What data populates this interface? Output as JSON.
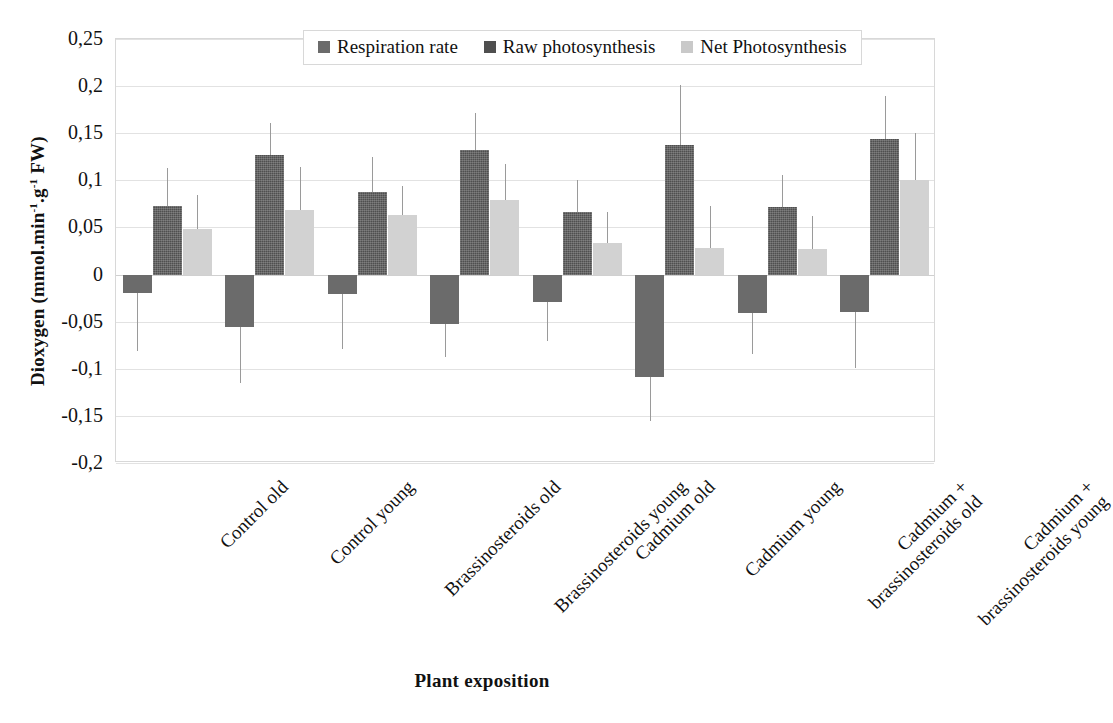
{
  "chart_data": {
    "type": "bar",
    "title": "",
    "xlabel": "Plant exposition",
    "ylabel": "Dioxygen (mmol.min-1.g-1 FW)",
    "ylabel_parts": {
      "main": "Dioxygen (mmol.min",
      "sup1": "-1",
      "mid": ".g",
      "sup2": "-1",
      "tail": " FW)"
    },
    "ylim": [
      -0.2,
      0.25
    ],
    "ytick_labels": [
      "0,25",
      "0,2",
      "0,15",
      "0,1",
      "0,05",
      "0",
      "-0,05",
      "-0,1",
      "-0,15",
      "-0,2"
    ],
    "ytick_values": [
      0.25,
      0.2,
      0.15,
      0.1,
      0.05,
      0,
      -0.05,
      -0.1,
      -0.15,
      -0.2
    ],
    "grid": true,
    "legend_position": "top-center",
    "decimal_separator": ",",
    "categories": [
      "Control old",
      "Control young",
      "Brassinosteroids old",
      "Brassinosteroids young",
      "Cadmium old",
      "Cadmium young",
      "Cadmium + brassinosteroids old",
      "Cadmium + brassinosteroids young"
    ],
    "category_lines": [
      [
        "Control old"
      ],
      [
        "Control young"
      ],
      [
        "Brassinosteroids old"
      ],
      [
        "Brassinosteroids young"
      ],
      [
        "Cadmium old"
      ],
      [
        "Cadmium young"
      ],
      [
        "Cadmium +",
        "brassinosteroids  old"
      ],
      [
        "Cadmium +",
        "brassinosteroids  young"
      ]
    ],
    "series": [
      {
        "name": "Respiration rate",
        "color": "#6b6b6b",
        "values": [
          -0.02,
          -0.056,
          -0.021,
          -0.052,
          -0.029,
          -0.109,
          -0.041,
          -0.04
        ],
        "errors": [
          0.061,
          0.059,
          0.058,
          0.036,
          0.042,
          0.046,
          0.043,
          0.059
        ]
      },
      {
        "name": "Raw photosynthesis",
        "color": "#4f4f4f",
        "values": [
          0.073,
          0.127,
          0.088,
          0.132,
          0.066,
          0.138,
          0.072,
          0.144
        ],
        "errors": [
          0.04,
          0.034,
          0.037,
          0.039,
          0.034,
          0.063,
          0.034,
          0.046
        ]
      },
      {
        "name": "Net Photosynthesis",
        "color": "#d2d2d2",
        "values": [
          0.048,
          0.069,
          0.063,
          0.079,
          0.033,
          0.028,
          0.027,
          0.1
        ],
        "errors": [
          0.036,
          0.045,
          0.031,
          0.038,
          0.033,
          0.045,
          0.035,
          0.05
        ]
      }
    ]
  },
  "legend": {
    "items": [
      {
        "label": "Respiration rate",
        "swatch": "respiration-swatch"
      },
      {
        "label": "Raw photosynthesis",
        "swatch": "raw-photosynthesis-swatch"
      },
      {
        "label": "Net Photosynthesis",
        "swatch": "net-photosynthesis-swatch"
      }
    ]
  }
}
